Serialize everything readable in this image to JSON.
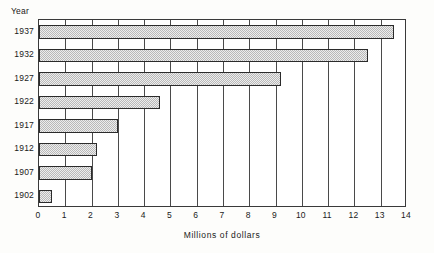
{
  "chart_data": {
    "type": "bar",
    "orientation": "horizontal",
    "title": "",
    "xlabel": "Millions of dollars",
    "ylabel": "Year",
    "categories": [
      "1937",
      "1932",
      "1927",
      "1922",
      "1917",
      "1912",
      "1907",
      "1902"
    ],
    "values": [
      13.5,
      12.5,
      9.2,
      4.6,
      3.0,
      2.2,
      2.0,
      0.5
    ],
    "xlim": [
      0,
      14
    ],
    "xticks": [
      0,
      1,
      2,
      3,
      4,
      5,
      6,
      7,
      8,
      9,
      10,
      11,
      12,
      13,
      14
    ],
    "xtick_labels": [
      "0",
      "1",
      "2",
      "3",
      "4",
      "5",
      "6",
      "7",
      "8",
      "9",
      "10",
      "11",
      "12",
      "13",
      "14"
    ],
    "grid": "vertical",
    "legend": "none",
    "bar_fill_color": "#b9b9b9",
    "bar_edge_color": "#2b2b2b",
    "axis_color": "#3a3a3a",
    "background_color": "#ffffff",
    "series": [
      {
        "name": "Millions of dollars",
        "values": [
          13.5,
          12.5,
          9.2,
          4.6,
          3.0,
          2.2,
          2.0,
          0.5
        ]
      }
    ]
  }
}
